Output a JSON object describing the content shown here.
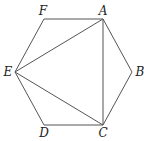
{
  "diagram": {
    "type": "regular-hexagon",
    "vertices": [
      "A",
      "B",
      "C",
      "D",
      "E",
      "F"
    ],
    "labels": {
      "A": "A",
      "B": "B",
      "C": "C",
      "D": "D",
      "E": "E",
      "F": "F"
    },
    "hexagon_edges": [
      [
        "A",
        "B"
      ],
      [
        "B",
        "C"
      ],
      [
        "C",
        "D"
      ],
      [
        "D",
        "E"
      ],
      [
        "E",
        "F"
      ],
      [
        "F",
        "A"
      ]
    ],
    "diagonals": [
      [
        "A",
        "E"
      ],
      [
        "A",
        "C"
      ],
      [
        "C",
        "E"
      ]
    ],
    "line_color": "#555555",
    "label_color": "#222222"
  }
}
